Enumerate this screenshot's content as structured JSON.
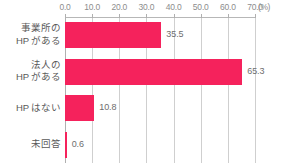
{
  "chart_data": {
    "type": "bar",
    "orientation": "horizontal",
    "title": "",
    "subtitle": "",
    "xlabel": "(%)",
    "ylabel": "",
    "categories": [
      "事業所の\nHP がある",
      "法人の\nHP がある",
      "HP はない",
      "未回答"
    ],
    "values": [
      35.5,
      65.3,
      10.8,
      0.6
    ],
    "value_labels": [
      "35.5",
      "65.3",
      "10.8",
      "0.6"
    ],
    "xlim": [
      0.0,
      70.0
    ],
    "xticks": [
      0.0,
      10.0,
      20.0,
      30.0,
      40.0,
      50.0,
      60.0,
      70.0
    ],
    "xtick_labels": [
      "0.0",
      "10.0",
      "20.0",
      "30.0",
      "40.0",
      "50.0",
      "60.0",
      "70.0"
    ],
    "unit_label": "(%)",
    "grid": true,
    "grid_axis": "x",
    "legend": null,
    "legend_position": "none",
    "bar_color": "#F5225C",
    "gridline_color": "#CFCFCF",
    "axis_color": "#B0B0B0",
    "label_color": "#595959",
    "tick_label_color": "#8D8D8D",
    "value_label_color": "#6E6E6E",
    "background_color": "#FFFFFF"
  }
}
